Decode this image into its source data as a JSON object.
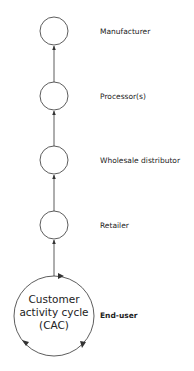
{
  "diagram": {
    "type": "supply-chain-flow",
    "direction": "bottom-to-top",
    "nodes": [
      {
        "id": "manufacturer",
        "label": "Manufacturer",
        "bold": false
      },
      {
        "id": "processor",
        "label": "Processor(s)",
        "bold": false
      },
      {
        "id": "wholesale",
        "label": "Wholesale distributor",
        "bold": false
      },
      {
        "id": "retailer",
        "label": "Retailer",
        "bold": false
      },
      {
        "id": "end-user",
        "label": "End-user",
        "bold": true
      }
    ],
    "cac": {
      "lines": [
        "Customer",
        "activity cycle",
        "(CAC)"
      ]
    },
    "edges": [
      {
        "from": "end-user",
        "to": "retailer"
      },
      {
        "from": "retailer",
        "to": "wholesale"
      },
      {
        "from": "wholesale",
        "to": "processor"
      },
      {
        "from": "processor",
        "to": "manufacturer"
      }
    ],
    "colors": {
      "stroke": "#333333",
      "text": "#222222",
      "background": "#ffffff"
    }
  }
}
